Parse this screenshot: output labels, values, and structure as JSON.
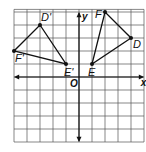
{
  "figure": {
    "type": "coordinate-plane-rotation",
    "axes": {
      "x_label": "x",
      "y_label": "y",
      "origin_label": "O"
    },
    "grid": {
      "x_range": [
        -5,
        5
      ],
      "y_range": [
        -5,
        5
      ]
    },
    "colors": {
      "grid": "#555555",
      "axis": "#111111",
      "shape": "#111111",
      "background": "#ffffff"
    },
    "triangle_original": {
      "points": [
        {
          "label": "D",
          "x": 4,
          "y": 3
        },
        {
          "label": "E",
          "x": 1,
          "y": 1
        },
        {
          "label": "F",
          "x": 2,
          "y": 5
        }
      ]
    },
    "triangle_image": {
      "points": [
        {
          "label": "D'",
          "x": -3,
          "y": 4
        },
        {
          "label": "E'",
          "x": -1,
          "y": 1
        },
        {
          "label": "F'",
          "x": -5,
          "y": 2
        }
      ]
    }
  }
}
